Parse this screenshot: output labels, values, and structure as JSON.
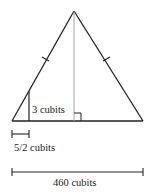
{
  "diagram": {
    "type": "isosceles-triangle-similar-triangles",
    "labels": {
      "small_height": "3 cubits",
      "small_base": "5/2 cubits",
      "full_base": "460 cubits"
    },
    "colors": {
      "stroke": "#222222",
      "altitude": "#9a9a9a",
      "background": "#ffffff"
    }
  }
}
